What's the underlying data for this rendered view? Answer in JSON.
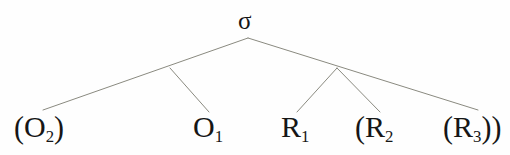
{
  "figure": {
    "kind": "syntactic-tree-diagram",
    "background_color": "#fefefe",
    "edge_color": "#8a8a80",
    "text_color": "#161616"
  },
  "tree": {
    "root": {
      "label": "σ",
      "name": "sigma",
      "x": 248,
      "y": 38
    },
    "internal_nodes": [
      {
        "name": "left-internal-node",
        "x": 170,
        "y": 68
      },
      {
        "name": "right-internal-node",
        "x": 337,
        "y": 68
      }
    ],
    "leaves": [
      {
        "name": "leaf-o2",
        "open_paren": "(",
        "base": "O",
        "sub": "2",
        "close_paren": ")",
        "text": "(O₂)",
        "x": 14,
        "y": 112,
        "edge_end_x": 43,
        "edge_end_y": 110
      },
      {
        "name": "leaf-o1",
        "open_paren": "",
        "base": "O",
        "sub": "1",
        "close_paren": "",
        "text": "O₁",
        "x": 193,
        "y": 112,
        "edge_end_x": 209,
        "edge_end_y": 112
      },
      {
        "name": "leaf-r1",
        "open_paren": "",
        "base": "R",
        "sub": "1",
        "close_paren": "",
        "text": "R₁",
        "x": 281,
        "y": 112,
        "edge_end_x": 297,
        "edge_end_y": 112
      },
      {
        "name": "leaf-r2",
        "open_paren": "(",
        "base": "R",
        "sub": "2",
        "close_paren": "",
        "text": "(R₂",
        "x": 355,
        "y": 112,
        "edge_end_x": 380,
        "edge_end_y": 112
      },
      {
        "name": "leaf-r3",
        "open_paren": "(",
        "base": "R",
        "sub": "3",
        "close_paren": "))",
        "text": "(R₃))",
        "x": 443,
        "y": 112,
        "edge_end_x": 478,
        "edge_end_y": 110
      }
    ],
    "edges": [
      {
        "name": "edge-root-to-left-branch",
        "x1": 248,
        "y1": 38,
        "x2": 43,
        "y2": 110
      },
      {
        "name": "edge-left-node-to-o1",
        "x1": 170,
        "y1": 68,
        "x2": 209,
        "y2": 112
      },
      {
        "name": "edge-root-to-right-branch",
        "x1": 248,
        "y1": 38,
        "x2": 478,
        "y2": 110
      },
      {
        "name": "edge-right-node-to-r1",
        "x1": 337,
        "y1": 68,
        "x2": 297,
        "y2": 112
      },
      {
        "name": "edge-right-node-to-r2",
        "x1": 337,
        "y1": 68,
        "x2": 380,
        "y2": 112
      }
    ]
  }
}
